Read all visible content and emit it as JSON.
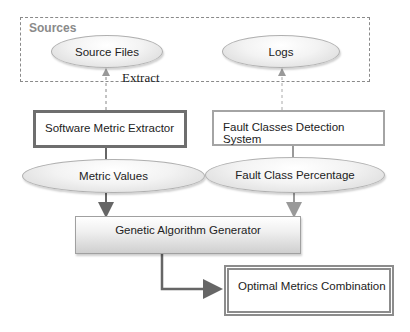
{
  "diagram": {
    "group_label": "Sources",
    "nodes": {
      "source_files": "Source Files",
      "logs": "Logs",
      "software_metric_extractor": "Software Metric Extractor",
      "fault_classes_detection_system": "Fault Classes Detection System",
      "metric_values": "Metric Values",
      "fault_class_percentage": "Fault Class Percentage",
      "genetic_algorithm_generator": "Genetic Algorithm Generator",
      "optimal_metrics_combination": "Optimal Metrics Combination"
    },
    "edge_labels": {
      "extract": "Extract"
    },
    "edges": [
      {
        "from": "Software Metric Extractor",
        "to": "Source Files",
        "style": "dashed",
        "label": "Extract"
      },
      {
        "from": "Fault Classes Detection System",
        "to": "Logs",
        "style": "dashed"
      },
      {
        "from": "Software Metric Extractor",
        "to": "Metric Values",
        "style": "solid"
      },
      {
        "from": "Fault Classes Detection System",
        "to": "Fault Class Percentage",
        "style": "solid"
      },
      {
        "from": "Metric Values",
        "to": "Genetic Algorithm Generator",
        "style": "solid"
      },
      {
        "from": "Fault Class Percentage",
        "to": "Genetic Algorithm Generator",
        "style": "solid"
      },
      {
        "from": "Genetic Algorithm Generator",
        "to": "Optimal Metrics Combination",
        "style": "solid"
      }
    ]
  }
}
